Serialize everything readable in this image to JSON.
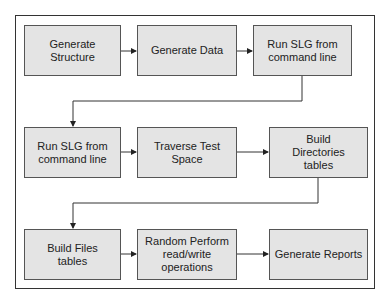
{
  "diagram": {
    "type": "flowchart",
    "rows": [
      {
        "nodes": [
          {
            "id": "n1",
            "label": "Generate Structure"
          },
          {
            "id": "n2",
            "label": "Generate Data"
          },
          {
            "id": "n3",
            "label": "Run SLG from command line"
          }
        ]
      },
      {
        "nodes": [
          {
            "id": "n4",
            "label": "Run SLG from command line"
          },
          {
            "id": "n5",
            "label": "Traverse Test Space"
          },
          {
            "id": "n6",
            "label": "Build Directories tables"
          }
        ]
      },
      {
        "nodes": [
          {
            "id": "n7",
            "label": "Build Files tables"
          },
          {
            "id": "n8",
            "label": "Random Perform read/write operations"
          },
          {
            "id": "n9",
            "label": "Generate Reports"
          }
        ]
      }
    ],
    "edges": [
      [
        "n1",
        "n2"
      ],
      [
        "n2",
        "n3"
      ],
      [
        "n3",
        "n4"
      ],
      [
        "n4",
        "n5"
      ],
      [
        "n5",
        "n6"
      ],
      [
        "n6",
        "n7"
      ],
      [
        "n7",
        "n8"
      ],
      [
        "n8",
        "n9"
      ]
    ],
    "colors": {
      "box_fill": "#e4e4e4",
      "box_border": "#555555",
      "line": "#333333"
    }
  }
}
